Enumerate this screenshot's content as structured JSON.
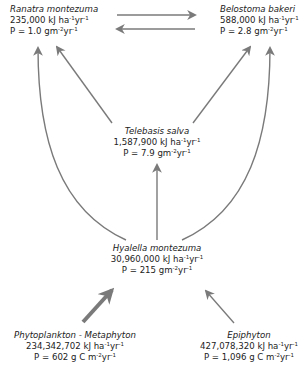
{
  "diagram": {
    "type": "food-web",
    "arrow_color": "#7a7a7a",
    "nodes": [
      {
        "id": "ranatra",
        "name": "Ranatra montezuma",
        "energy_value": "235,000",
        "energy_unit": "kJ ha",
        "energy_exp1": "-1",
        "energy_unit2": "yr",
        "energy_exp2": "-1",
        "prod_label": "P = 1.0 gm",
        "prod_exp1": "-2",
        "prod_unit2": "yr",
        "prod_exp2": "-1"
      },
      {
        "id": "belostoma",
        "name": "Belostoma bakeri",
        "energy_value": "588,000",
        "energy_unit": "kJ ha",
        "energy_exp1": "-1",
        "energy_unit2": "yr",
        "energy_exp2": "-1",
        "prod_label": "P = 2.8 gm",
        "prod_exp1": "-2",
        "prod_unit2": "yr",
        "prod_exp2": "-1"
      },
      {
        "id": "telebasis",
        "name": "Telebasis salva",
        "energy_value": "1,587,900",
        "energy_unit": "kJ ha",
        "energy_exp1": "-1",
        "energy_unit2": "yr",
        "energy_exp2": "-1",
        "prod_label": "P = 7.9 gm",
        "prod_exp1": "-2",
        "prod_unit2": "yr",
        "prod_exp2": "-1"
      },
      {
        "id": "hyalella",
        "name": "Hyalella montezuma",
        "energy_value": "30,960,000",
        "energy_unit": "kJ ha",
        "energy_exp1": "-1",
        "energy_unit2": "yr",
        "energy_exp2": "-1",
        "prod_label": "P = 215 gm",
        "prod_exp1": "-2",
        "prod_unit2": "yr",
        "prod_exp2": "-1"
      },
      {
        "id": "phyto",
        "name": "Phytoplankton - Metaphyton",
        "energy_value": "234,342,702",
        "energy_unit": "kJ ha",
        "energy_exp1": "-1",
        "energy_unit2": "yr",
        "energy_exp2": "-1",
        "prod_label": "P = 602 g C m",
        "prod_exp1": "-2",
        "prod_unit2": "yr",
        "prod_exp2": "-1"
      },
      {
        "id": "epiphyton",
        "name": "Epiphyton",
        "energy_value": "427,078,320",
        "energy_unit": "kJ ha",
        "energy_exp1": "-1",
        "energy_unit2": "yr",
        "energy_exp2": "-1",
        "prod_label": "P = 1,096 g C m",
        "prod_exp1": "-2",
        "prod_unit2": "yr",
        "prod_exp2": "-1"
      }
    ],
    "edges": [
      {
        "from": "ranatra",
        "to": "belostoma"
      },
      {
        "from": "belostoma",
        "to": "ranatra"
      },
      {
        "from": "telebasis",
        "to": "ranatra"
      },
      {
        "from": "telebasis",
        "to": "belostoma"
      },
      {
        "from": "hyalella",
        "to": "telebasis"
      },
      {
        "from": "hyalella",
        "to": "ranatra"
      },
      {
        "from": "hyalella",
        "to": "belostoma"
      },
      {
        "from": "phyto",
        "to": "hyalella",
        "weight": "thick"
      },
      {
        "from": "epiphyton",
        "to": "hyalella"
      }
    ]
  }
}
